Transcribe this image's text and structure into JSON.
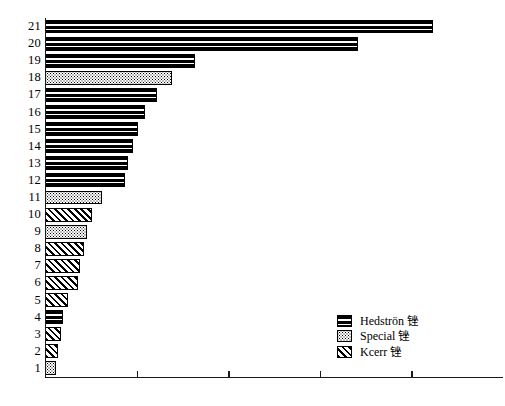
{
  "chart_data": {
    "type": "bar",
    "orientation": "horizontal",
    "title": "",
    "xlabel": "",
    "ylabel": "",
    "grid": false,
    "xlim": [
      0,
      5
    ],
    "x_tick_values": [
      0,
      1,
      2,
      3,
      4
    ],
    "x_tick_labels": [
      "",
      "",
      "",
      "",
      ""
    ],
    "categories": [
      "1",
      "2",
      "3",
      "4",
      "5",
      "6",
      "7",
      "8",
      "9",
      "10",
      "11",
      "12",
      "13",
      "14",
      "15",
      "16",
      "17",
      "18",
      "19",
      "20",
      "21"
    ],
    "legend_position": "lower-right",
    "legend": [
      {
        "name": "Hedströn 锉",
        "pattern": "horizontal-stripes"
      },
      {
        "name": "Special 锉",
        "pattern": "stipple"
      },
      {
        "name": "Kcerr 锉",
        "pattern": "diagonal-hatch"
      }
    ],
    "bars": [
      {
        "category": "21",
        "value": 4.24,
        "group": "Hedströn 锉"
      },
      {
        "category": "20",
        "value": 3.42,
        "group": "Hedströn 锉"
      },
      {
        "category": "19",
        "value": 1.64,
        "group": "Hedströn 锉"
      },
      {
        "category": "18",
        "value": 1.39,
        "group": "Special 锉"
      },
      {
        "category": "17",
        "value": 1.22,
        "group": "Hedströn 锉"
      },
      {
        "category": "16",
        "value": 1.09,
        "group": "Hedströn 锉"
      },
      {
        "category": "15",
        "value": 1.02,
        "group": "Hedströn 锉"
      },
      {
        "category": "14",
        "value": 0.96,
        "group": "Hedströn 锉"
      },
      {
        "category": "13",
        "value": 0.91,
        "group": "Hedströn 锉"
      },
      {
        "category": "12",
        "value": 0.87,
        "group": "Hedströn 锉"
      },
      {
        "category": "11",
        "value": 0.62,
        "group": "Special 锉"
      },
      {
        "category": "10",
        "value": 0.51,
        "group": "Kcerr 锉"
      },
      {
        "category": "9",
        "value": 0.46,
        "group": "Special 锉"
      },
      {
        "category": "8",
        "value": 0.43,
        "group": "Kcerr 锉"
      },
      {
        "category": "7",
        "value": 0.38,
        "group": "Kcerr 锉"
      },
      {
        "category": "6",
        "value": 0.36,
        "group": "Kcerr 锉"
      },
      {
        "category": "5",
        "value": 0.25,
        "group": "Kcerr 锉"
      },
      {
        "category": "4",
        "value": 0.2,
        "group": "Hedströn 锉"
      },
      {
        "category": "3",
        "value": 0.17,
        "group": "Kcerr 锉"
      },
      {
        "category": "2",
        "value": 0.14,
        "group": "Kcerr 锉"
      },
      {
        "category": "1",
        "value": 0.12,
        "group": "Special 锉"
      }
    ]
  },
  "colors": {
    "ink": "#000000",
    "axis": "#1a1a1a",
    "background": "#ffffff"
  }
}
